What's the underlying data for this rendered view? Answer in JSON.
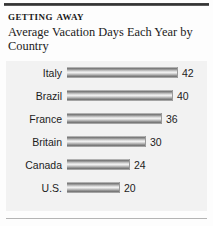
{
  "headline": {
    "kicker": "Getting Away",
    "subtitle": "Average Vacation Days Each Year by Country"
  },
  "colors": {
    "panel_background": "#f2f2f2",
    "page_background": "#fdfdfd",
    "top_rule": "#2e2e2e",
    "bottom_rule": "#b4b4b4",
    "bar_dark": "#6a6a6a",
    "bar_light": "#efefef",
    "text": "#1c1c1c"
  },
  "chart_data": {
    "type": "bar",
    "orientation": "horizontal",
    "title": "Getting Away",
    "subtitle": "Average Vacation Days Each Year by Country",
    "xlabel": "",
    "ylabel": "",
    "grid": false,
    "legend": false,
    "axis_visible": false,
    "value_labels": true,
    "xlim": [
      0,
      46
    ],
    "categories": [
      "Italy",
      "Brazil",
      "France",
      "Britain",
      "Canada",
      "U.S."
    ],
    "values": [
      42,
      40,
      36,
      30,
      24,
      20
    ],
    "value_text": [
      "42",
      "40",
      "36",
      "30",
      "24",
      "20"
    ],
    "units": "days per year"
  }
}
